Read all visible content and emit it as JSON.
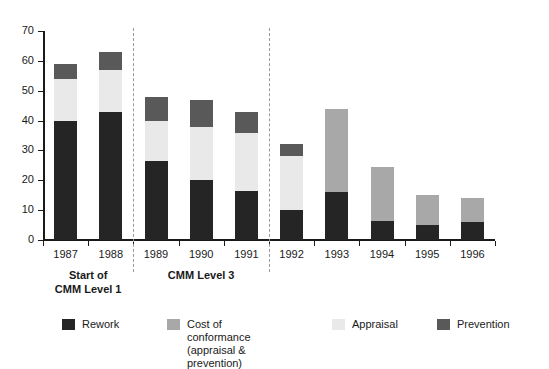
{
  "chart_data": {
    "type": "bar",
    "stacked": true,
    "title": "",
    "subtitle": "",
    "xlabel": "",
    "ylabel": "",
    "ylim": [
      0,
      70
    ],
    "ytick_values": [
      0,
      10,
      20,
      30,
      40,
      50,
      60,
      70
    ],
    "ytick_labels": [
      "0",
      "10",
      "20",
      "30",
      "40",
      "50",
      "60",
      "70"
    ],
    "grid": false,
    "legend_position": "bottom",
    "categories": [
      "1987",
      "1988",
      "1989",
      "1990",
      "1991",
      "1992",
      "1993",
      "1994",
      "1995",
      "1996"
    ],
    "series": [
      {
        "name": "Rework",
        "color": "#252525",
        "values": [
          40,
          43,
          26.5,
          20,
          16.5,
          10,
          16,
          6.5,
          5,
          6
        ]
      },
      {
        "name": "Cost of conformance (appraisal & prevention)",
        "color": "#a8a8a8",
        "values": [
          0,
          0,
          0,
          0,
          0,
          0,
          28,
          18,
          10,
          8
        ]
      },
      {
        "name": "Appraisal",
        "color": "#e9e9e9",
        "values": [
          14,
          14,
          13.5,
          18,
          19.5,
          18,
          0,
          0,
          0,
          0
        ]
      },
      {
        "name": "Prevention",
        "color": "#595959",
        "values": [
          5,
          6,
          8,
          9,
          7,
          4,
          0,
          0,
          0,
          0
        ]
      }
    ],
    "totals": [
      59,
      63,
      48,
      47,
      43,
      32,
      44,
      24.5,
      15,
      14
    ],
    "annotations": [
      {
        "text": "Start of\nCMM Level 1",
        "span": [
          "1987",
          "1988"
        ]
      },
      {
        "text": "CMM Level 3",
        "span": [
          "1989",
          "1990",
          "1991"
        ]
      }
    ],
    "separators_after": [
      "1988",
      "1991"
    ]
  },
  "legend": {
    "items": [
      {
        "label": "Rework",
        "color": "#252525"
      },
      {
        "label": "Cost of conformance\n(appraisal & prevention)",
        "color": "#a8a8a8"
      },
      {
        "label": "Appraisal",
        "color": "#e9e9e9"
      },
      {
        "label": "Prevention",
        "color": "#595959"
      }
    ]
  },
  "group_labels": [
    {
      "text": "Start of\nCMM Level 1"
    },
    {
      "text": "CMM Level 3"
    }
  ],
  "colors": {
    "rework": "#252525",
    "cost_of_conformance": "#a8a8a8",
    "appraisal": "#e9e9e9",
    "prevention": "#595959",
    "axis": "#1a1a1a",
    "separator": "#9a9a9a",
    "background": "#ffffff"
  }
}
